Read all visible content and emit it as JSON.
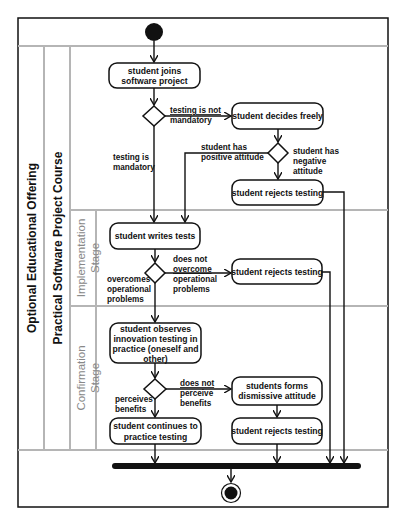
{
  "diagram": {
    "type": "UML activity diagram",
    "partitions": {
      "outer": "Optional Educational Offering",
      "inner": "Practical Software Project Course",
      "stages": [
        {
          "label_line1": "Implementation",
          "label_line2": "Stage"
        },
        {
          "label_line1": "Confirmation",
          "label_line2": "Stage"
        }
      ]
    },
    "nodes": {
      "joins": {
        "line1": "student joins",
        "line2": "software project"
      },
      "decides": {
        "line1": "student decides freely"
      },
      "rejects_1": {
        "line1": "student rejects testing"
      },
      "writes": {
        "line1": "student writes tests"
      },
      "rejects_2": {
        "line1": "student rejects testing"
      },
      "observes": {
        "line1": "student observes",
        "line2": "innovation testing in",
        "line3": "practice (oneself and",
        "line4": "other)"
      },
      "dismissive": {
        "line1": "students forms",
        "line2": "dismissive attitude"
      },
      "continues": {
        "line1": "student continues to",
        "line2": "practice testing"
      },
      "rejects_3": {
        "line1": "student rejects testing"
      }
    },
    "guards": {
      "not_mandatory": {
        "line1": "testing is not",
        "line2": "mandatory"
      },
      "mandatory": {
        "line1": "testing is",
        "line2": "mandatory"
      },
      "positive": {
        "line1": "student has",
        "line2": "positive attitude"
      },
      "negative": {
        "line1": "student has",
        "line2": "negative",
        "line3": "attitude"
      },
      "not_overcome": {
        "line1": "does not",
        "line2": "overcome",
        "line3": "operational",
        "line4": "problems"
      },
      "overcomes": {
        "line1": "overcomes",
        "line2": "operational",
        "line3": "problems"
      },
      "not_perceive": {
        "line1": "does not",
        "line2": "perceive",
        "line3": "benefits"
      },
      "perceives": {
        "line1": "perceives",
        "line2": "benefits"
      }
    },
    "colors": {
      "stroke": "#111111",
      "lane_divider": "#b5b5b5",
      "stage_label": "#888888"
    }
  }
}
